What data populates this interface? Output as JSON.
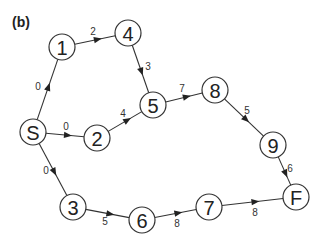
{
  "panel_label": "(b)",
  "style": {
    "node_radius": 13,
    "stroke_color": "#333333",
    "text_color": "#222222"
  },
  "nodes": [
    {
      "id": "S",
      "label": "S",
      "x": 33,
      "y": 132
    },
    {
      "id": "1",
      "label": "1",
      "x": 62,
      "y": 47
    },
    {
      "id": "2",
      "label": "2",
      "x": 97,
      "y": 138
    },
    {
      "id": "3",
      "label": "3",
      "x": 73,
      "y": 207
    },
    {
      "id": "4",
      "label": "4",
      "x": 128,
      "y": 33
    },
    {
      "id": "5",
      "label": "5",
      "x": 153,
      "y": 105
    },
    {
      "id": "6",
      "label": "6",
      "x": 142,
      "y": 220
    },
    {
      "id": "7",
      "label": "7",
      "x": 209,
      "y": 207
    },
    {
      "id": "8",
      "label": "8",
      "x": 215,
      "y": 90
    },
    {
      "id": "9",
      "label": "9",
      "x": 273,
      "y": 145
    },
    {
      "id": "F",
      "label": "F",
      "x": 296,
      "y": 197
    }
  ],
  "edges": [
    {
      "from": "S",
      "to": "1",
      "weight": "0",
      "lx": 38,
      "ly": 86
    },
    {
      "from": "S",
      "to": "2",
      "weight": "0",
      "lx": 66,
      "ly": 126
    },
    {
      "from": "S",
      "to": "3",
      "weight": "0",
      "lx": 46,
      "ly": 170
    },
    {
      "from": "1",
      "to": "4",
      "weight": "2",
      "lx": 93,
      "ly": 31
    },
    {
      "from": "4",
      "to": "5",
      "weight": "3",
      "lx": 148,
      "ly": 66
    },
    {
      "from": "2",
      "to": "5",
      "weight": "4",
      "lx": 123,
      "ly": 113
    },
    {
      "from": "5",
      "to": "8",
      "weight": "7",
      "lx": 182,
      "ly": 88
    },
    {
      "from": "8",
      "to": "9",
      "weight": "5",
      "lx": 247,
      "ly": 110
    },
    {
      "from": "9",
      "to": "F",
      "weight": "6",
      "lx": 290,
      "ly": 168
    },
    {
      "from": "3",
      "to": "6",
      "weight": "5",
      "lx": 105,
      "ly": 221
    },
    {
      "from": "6",
      "to": "7",
      "weight": "8",
      "lx": 177,
      "ly": 223
    },
    {
      "from": "7",
      "to": "F",
      "weight": "8",
      "lx": 255,
      "ly": 212
    }
  ]
}
